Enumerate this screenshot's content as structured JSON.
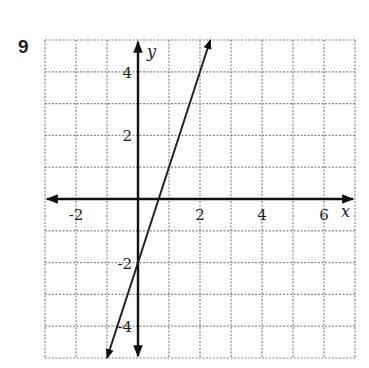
{
  "problem": {
    "number": "9"
  },
  "chart_data": {
    "type": "line",
    "title": "",
    "xlabel": "x",
    "ylabel": "y",
    "xlim": [
      -3,
      7
    ],
    "ylim": [
      -5,
      5
    ],
    "grid": true,
    "grid_style": "dashed",
    "x_ticks": [
      -2,
      2,
      4,
      6
    ],
    "x_tick_labels": [
      "-2",
      "2",
      "4",
      "6"
    ],
    "y_ticks": [
      4,
      2,
      -2,
      -4
    ],
    "y_tick_labels": [
      "4",
      "2",
      "-2",
      "-4"
    ],
    "series": [
      {
        "name": "line",
        "equation": "y = 3x - 2",
        "slope": 3,
        "intercept": -2,
        "x": [
          -1,
          0,
          0.667,
          2.333
        ],
        "y": [
          -5,
          -2,
          0,
          5
        ],
        "arrows": "both"
      }
    ],
    "legend": null
  },
  "colors": {
    "grid": "#888888",
    "axis": "#111111",
    "line": "#222222",
    "text": "#222222"
  }
}
